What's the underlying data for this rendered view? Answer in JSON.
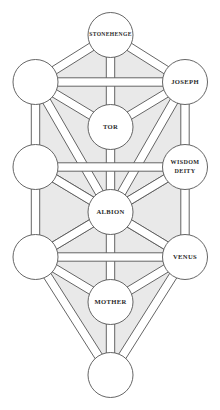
{
  "diagram": {
    "type": "sephirotic-tree",
    "colors": {
      "background": "#ffffff",
      "shading": "#e9e9e9",
      "stroke": "#555555",
      "node_fill": "#ffffff",
      "band_fill": "#ffffff",
      "text": "#2b2b2b"
    },
    "geometry": {
      "width": 220,
      "height": 410,
      "node_radius": 22.5,
      "band_half_width": 4.2,
      "stroke_width": 0.9
    },
    "nodes": [
      {
        "id": "keter",
        "label": "STONEHENGE",
        "lines": [
          "STONEHENGE"
        ],
        "cx": 110.5,
        "cy": 35,
        "font_size": 5.6,
        "pillar": "middle"
      },
      {
        "id": "binah",
        "label": "",
        "lines": [],
        "cx": 35.5,
        "cy": 82,
        "font_size": 6.2,
        "pillar": "left"
      },
      {
        "id": "chokhmah",
        "label": "JOSEPH",
        "lines": [
          "JOSEPH"
        ],
        "cx": 185,
        "cy": 82,
        "font_size": 6.6,
        "pillar": "right"
      },
      {
        "id": "daat",
        "label": "TOR",
        "lines": [
          "TOR"
        ],
        "cx": 110.5,
        "cy": 127,
        "font_size": 6.6,
        "pillar": "middle"
      },
      {
        "id": "gevurah",
        "label": "",
        "lines": [],
        "cx": 35.5,
        "cy": 167,
        "font_size": 6.2,
        "pillar": "left"
      },
      {
        "id": "chesed",
        "label": "WISDOM DEITY",
        "lines": [
          "WISDOM",
          "DEITY"
        ],
        "cx": 185,
        "cy": 167,
        "font_size": 6.1,
        "pillar": "right"
      },
      {
        "id": "tiferet",
        "label": "ALBION",
        "lines": [
          "ALBION"
        ],
        "cx": 110.5,
        "cy": 212,
        "font_size": 6.6,
        "pillar": "middle"
      },
      {
        "id": "hod",
        "label": "",
        "lines": [],
        "cx": 35.5,
        "cy": 257,
        "font_size": 6.2,
        "pillar": "left"
      },
      {
        "id": "netzach",
        "label": "VENUS",
        "lines": [
          "VENUS"
        ],
        "cx": 185,
        "cy": 257,
        "font_size": 6.6,
        "pillar": "right"
      },
      {
        "id": "yesod",
        "label": "MOTHER",
        "lines": [
          "MOTHER"
        ],
        "cx": 110.5,
        "cy": 302,
        "font_size": 6.6,
        "pillar": "middle"
      },
      {
        "id": "malkhut",
        "label": "",
        "lines": [],
        "cx": 110.5,
        "cy": 375,
        "font_size": 6.2,
        "pillar": "middle"
      }
    ],
    "paths": [
      {
        "from": "keter",
        "to": "binah"
      },
      {
        "from": "keter",
        "to": "chokhmah"
      },
      {
        "from": "keter",
        "to": "daat"
      },
      {
        "from": "binah",
        "to": "chokhmah"
      },
      {
        "from": "binah",
        "to": "daat"
      },
      {
        "from": "chokhmah",
        "to": "daat"
      },
      {
        "from": "binah",
        "to": "gevurah"
      },
      {
        "from": "chokhmah",
        "to": "chesed"
      },
      {
        "from": "binah",
        "to": "tiferet"
      },
      {
        "from": "chokhmah",
        "to": "tiferet"
      },
      {
        "from": "daat",
        "to": "tiferet"
      },
      {
        "from": "gevurah",
        "to": "chesed"
      },
      {
        "from": "gevurah",
        "to": "tiferet"
      },
      {
        "from": "chesed",
        "to": "tiferet"
      },
      {
        "from": "gevurah",
        "to": "hod"
      },
      {
        "from": "chesed",
        "to": "netzach"
      },
      {
        "from": "gevurah",
        "to": "netzach"
      },
      {
        "from": "chesed",
        "to": "hod"
      },
      {
        "from": "tiferet",
        "to": "hod"
      },
      {
        "from": "tiferet",
        "to": "netzach"
      },
      {
        "from": "tiferet",
        "to": "yesod"
      },
      {
        "from": "hod",
        "to": "netzach"
      },
      {
        "from": "hod",
        "to": "yesod"
      },
      {
        "from": "netzach",
        "to": "yesod"
      },
      {
        "from": "hod",
        "to": "malkhut"
      },
      {
        "from": "netzach",
        "to": "malkhut"
      },
      {
        "from": "yesod",
        "to": "malkhut"
      }
    ],
    "shaded_regions": [
      [
        "keter",
        "binah",
        "chokhmah"
      ],
      [
        "keter",
        "binah",
        "daat"
      ],
      [
        "keter",
        "chokhmah",
        "daat"
      ],
      [
        "binah",
        "chokhmah",
        "daat"
      ],
      [
        "binah",
        "daat",
        "tiferet"
      ],
      [
        "chokhmah",
        "daat",
        "tiferet"
      ],
      [
        "binah",
        "gevurah",
        "tiferet"
      ],
      [
        "chokhmah",
        "chesed",
        "tiferet"
      ],
      [
        "gevurah",
        "chesed",
        "tiferet"
      ],
      [
        "gevurah",
        "chesed",
        "netzach"
      ],
      [
        "gevurah",
        "chesed",
        "hod"
      ],
      [
        "gevurah",
        "hod",
        "tiferet"
      ],
      [
        "chesed",
        "netzach",
        "tiferet"
      ],
      [
        "gevurah",
        "hod",
        "netzach"
      ],
      [
        "chesed",
        "hod",
        "netzach"
      ],
      [
        "tiferet",
        "hod",
        "netzach"
      ],
      [
        "tiferet",
        "hod",
        "yesod"
      ],
      [
        "tiferet",
        "netzach",
        "yesod"
      ],
      [
        "hod",
        "netzach",
        "yesod"
      ],
      [
        "hod",
        "yesod",
        "malkhut"
      ],
      [
        "netzach",
        "yesod",
        "malkhut"
      ],
      [
        "hod",
        "netzach",
        "malkhut"
      ]
    ]
  }
}
